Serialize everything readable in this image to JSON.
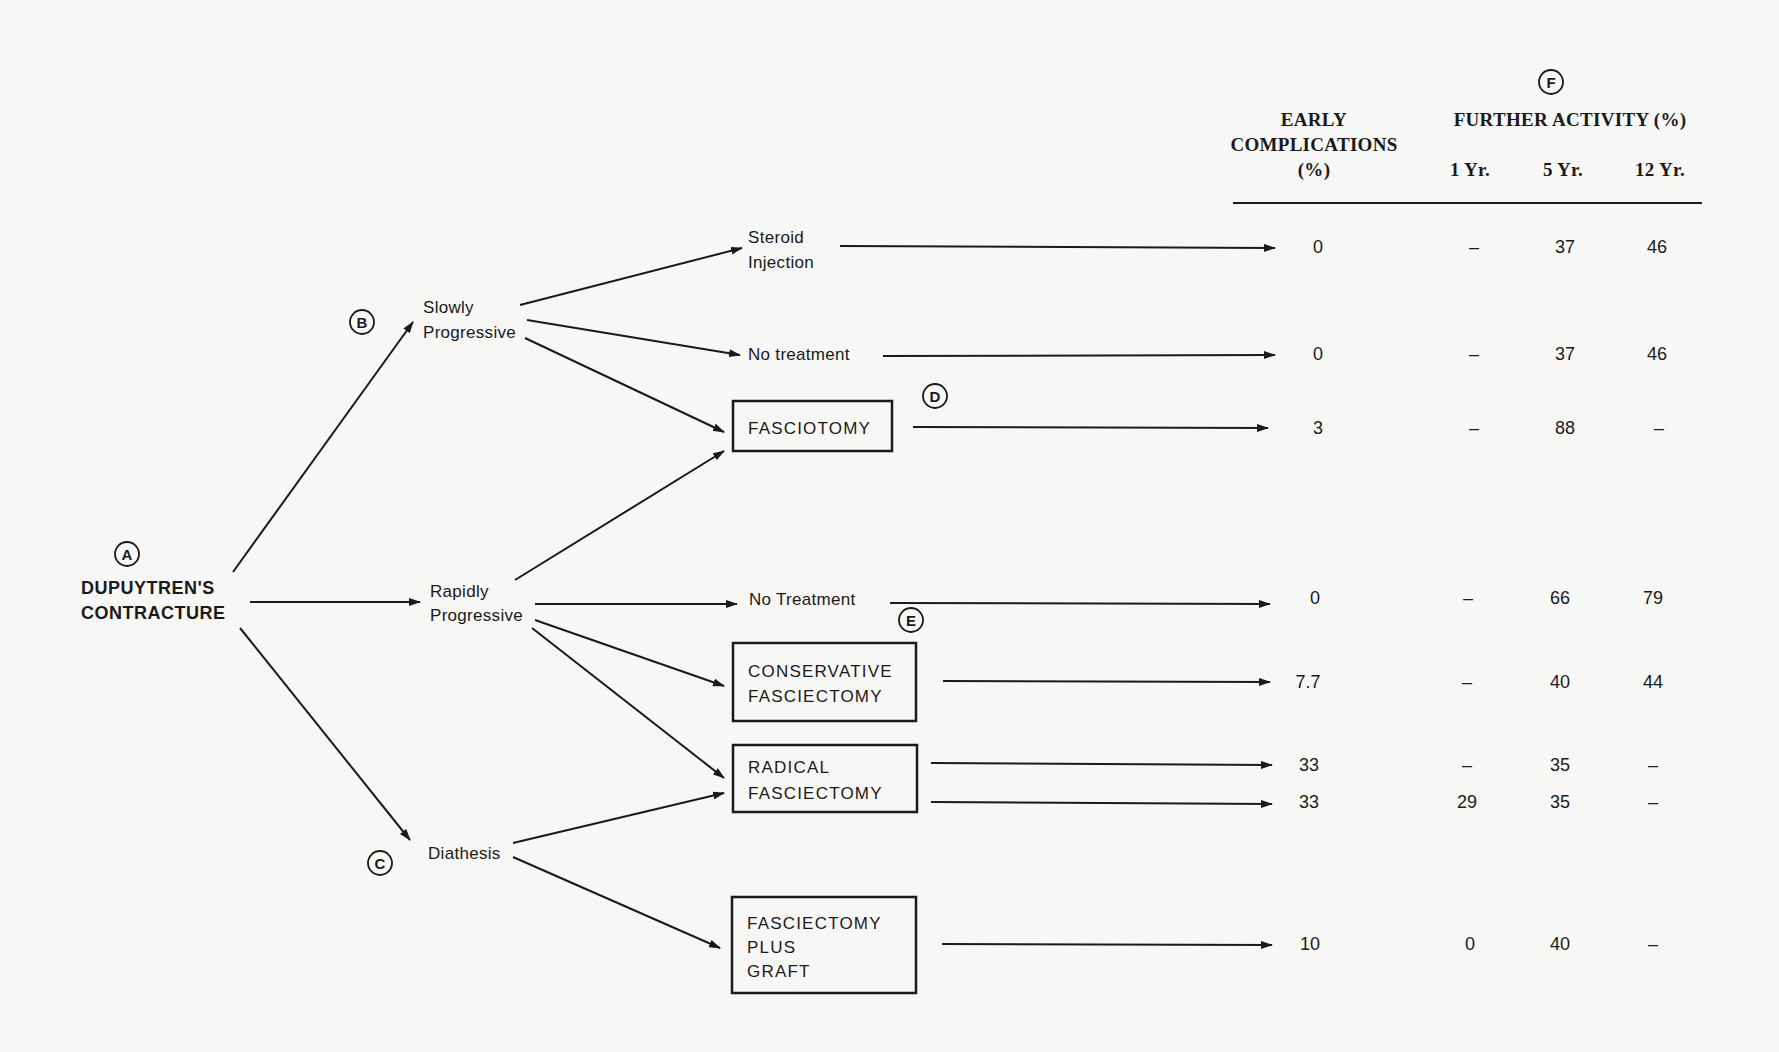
{
  "markers": {
    "a": "A",
    "b": "B",
    "c": "C",
    "d": "D",
    "e": "E",
    "f": "F"
  },
  "root": {
    "line1": "DUPUYTREN'S",
    "line2": "CONTRACTURE"
  },
  "branches": {
    "slowly": {
      "line1": "Slowly",
      "line2": "Progressive"
    },
    "rapidly": {
      "line1": "Rapidly",
      "line2": "Progressive"
    },
    "diathesis": {
      "line1": "Diathesis"
    }
  },
  "treatments": {
    "steroid": {
      "line1": "Steroid",
      "line2": "Injection"
    },
    "no_treatment_slow": {
      "line1": "No treatment"
    },
    "fasciotomy": {
      "line1": "FASCIOTOMY"
    },
    "no_treatment_rapid": {
      "line1": "No Treatment"
    },
    "conservative": {
      "line1": "CONSERVATIVE",
      "line2": "FASCIECTOMY"
    },
    "radical": {
      "line1": "RADICAL",
      "line2": "FASCIECTOMY"
    },
    "graft": {
      "line1": "FASCIECTOMY",
      "line2": "PLUS",
      "line3": "GRAFT"
    }
  },
  "table": {
    "header": {
      "early_line1": "EARLY",
      "early_line2": "COMPLICATIONS",
      "early_line3": "(%)",
      "further": "FURTHER ACTIVITY (%)",
      "yr1": "1 Yr.",
      "yr5": "5 Yr.",
      "yr12": "12 Yr."
    },
    "rows": [
      {
        "treatment": "Steroid Injection",
        "early": "0",
        "yr1": "–",
        "yr5": "37",
        "yr12": "46"
      },
      {
        "treatment": "No treatment (slowly progressive)",
        "early": "0",
        "yr1": "–",
        "yr5": "37",
        "yr12": "46"
      },
      {
        "treatment": "Fasciotomy",
        "early": "3",
        "yr1": "–",
        "yr5": "88",
        "yr12": "–"
      },
      {
        "treatment": "No Treatment (rapidly progressive)",
        "early": "0",
        "yr1": "–",
        "yr5": "66",
        "yr12": "79"
      },
      {
        "treatment": "Conservative Fasciectomy",
        "early": "7.7",
        "yr1": "–",
        "yr5": "40",
        "yr12": "44"
      },
      {
        "treatment": "Radical Fasciectomy (rapidly progressive)",
        "early": "33",
        "yr1": "–",
        "yr5": "35",
        "yr12": "–"
      },
      {
        "treatment": "Radical Fasciectomy (diathesis)",
        "early": "33",
        "yr1": "29",
        "yr5": "35",
        "yr12": "–"
      },
      {
        "treatment": "Fasciectomy plus Graft",
        "early": "10",
        "yr1": "0",
        "yr5": "40",
        "yr12": "–"
      }
    ]
  }
}
